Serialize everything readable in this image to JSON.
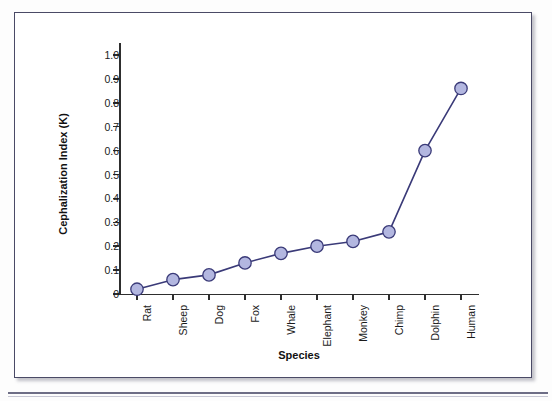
{
  "figure": {
    "y_axis_title": "Cephalization Index (K)",
    "x_axis_title": "Species"
  },
  "chart_data": {
    "type": "line",
    "title": "",
    "xlabel": "Species",
    "ylabel": "Cephalization Index (K)",
    "categories": [
      "Rat",
      "Sheep",
      "Dog",
      "Fox",
      "Whale",
      "Elephant",
      "Monkey",
      "Chimp",
      "Dolphin",
      "Human"
    ],
    "values": [
      0.02,
      0.06,
      0.08,
      0.13,
      0.17,
      0.2,
      0.22,
      0.26,
      0.6,
      0.86
    ],
    "series": [
      {
        "name": "Cephalization Index",
        "values": [
          0.02,
          0.06,
          0.08,
          0.13,
          0.17,
          0.2,
          0.22,
          0.26,
          0.6,
          0.86
        ]
      }
    ],
    "ylim": [
      0,
      1.05
    ],
    "yticks": [
      0,
      0.1,
      0.2,
      0.3,
      0.4,
      0.5,
      0.6,
      0.7,
      0.8,
      0.9,
      1.0
    ],
    "ytick_labels": [
      "0",
      "0.1",
      "0.2",
      "0.3",
      "0.4",
      "0.5",
      "0.6",
      "0.7",
      "0.8",
      "0.9",
      "1.0"
    ],
    "grid": false,
    "legend": "none",
    "marker": "circle",
    "marker_fill_color": "#b3b7e0",
    "marker_edge_color": "#3a3a78",
    "line_color": "#3a3a78"
  }
}
